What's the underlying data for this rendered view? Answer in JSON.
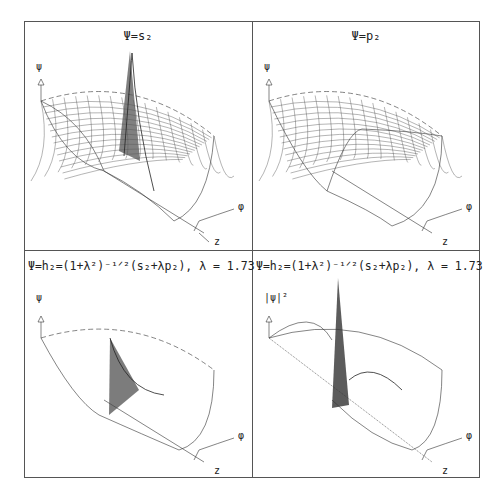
{
  "figure": {
    "panels": [
      {
        "id": "p1",
        "title": "Ψ=s₂",
        "ylabel": "ψ",
        "axis_x": "φ",
        "axis_z": "z",
        "feature": "single sharp peak (s-orbital)"
      },
      {
        "id": "p2",
        "title": "Ψ=p₂",
        "ylabel": "ψ",
        "axis_x": "φ",
        "axis_z": "z",
        "feature": "saddle twist (p-orbital)"
      },
      {
        "id": "p3",
        "title": "Ψ=h₂=(1+λ²)⁻¹ᐟ²(s₂+λp₂),  λ  =  1.73",
        "ylabel": "ψ",
        "axis_x": "φ",
        "axis_z": "z",
        "feature": "hybrid peak"
      },
      {
        "id": "p4",
        "title": "Ψ=h₂=(1+λ²)⁻¹ᐟ²(s₂+λp₂),  λ  =  1.73",
        "ylabel": "|ψ|²",
        "axis_x": "φ",
        "axis_z": "z",
        "feature": "hybrid density peak"
      }
    ],
    "lambda": "1.73"
  }
}
